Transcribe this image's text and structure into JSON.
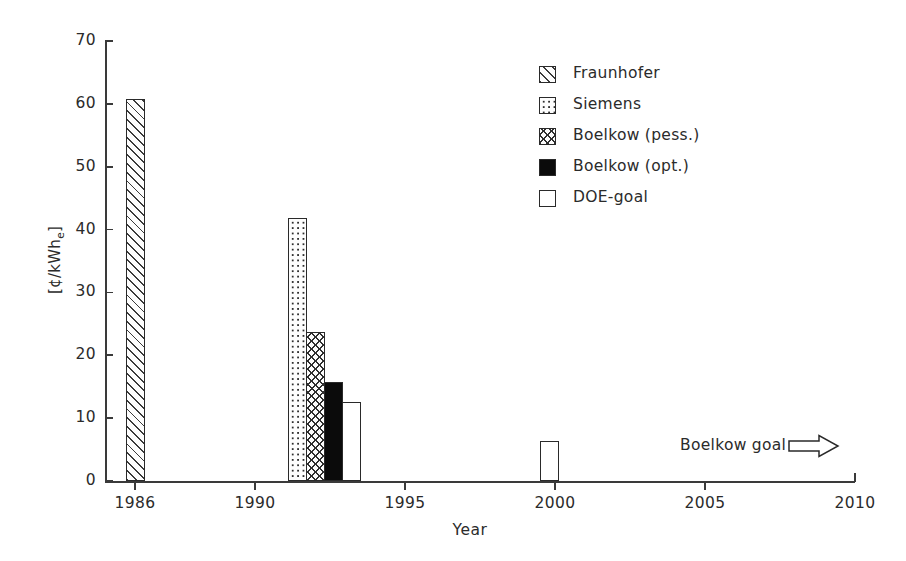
{
  "chart_data": {
    "type": "bar",
    "title": "",
    "xlabel": "Year",
    "ylabel": "[¢/kWhₑ]",
    "ylabel_parts": {
      "prefix": "[¢/kWh",
      "sub": "e",
      "suffix": "]"
    },
    "xlim": [
      1985,
      2010
    ],
    "ylim": [
      0,
      70
    ],
    "ytick_labels": [
      "0",
      "10",
      "20",
      "30",
      "40",
      "50",
      "60",
      "70"
    ],
    "ytick_values": [
      0,
      10,
      20,
      30,
      40,
      50,
      60,
      70
    ],
    "xtick_labels": [
      "1986",
      "1990",
      "1995",
      "2000",
      "2005",
      "2010"
    ],
    "xtick_values": [
      1986,
      1990,
      1995,
      2000,
      2005,
      2010
    ],
    "grid": false,
    "legend_position": "upper-center-right",
    "series": [
      {
        "name": "Fraunhofer",
        "pattern": "diagonal-hatch",
        "x": 1986,
        "value": 60.7
      },
      {
        "name": "Siemens",
        "pattern": "dots",
        "x": 1991.4,
        "value": 41.8
      },
      {
        "name": "Boelkow (pess.)",
        "pattern": "crosshatch",
        "x": 1992.0,
        "value": 23.7
      },
      {
        "name": "Boelkow (opt.)",
        "pattern": "solid-black",
        "x": 1992.6,
        "value": 15.7
      },
      {
        "name": "DOE-goal",
        "pattern": "empty",
        "x": 1993.2,
        "value": 12.6
      },
      {
        "name": "DOE-goal",
        "pattern": "empty",
        "x": 1999.8,
        "value": 6.3
      }
    ],
    "annotations": [
      {
        "text": "Boelkow goal",
        "icon": "right-arrow-icon",
        "x": 2006.5,
        "y": 7.2
      }
    ]
  },
  "legend": {
    "items": [
      {
        "label": "Fraunhofer",
        "pattern": "pat-hatch"
      },
      {
        "label": "Siemens",
        "pattern": "pat-dots"
      },
      {
        "label": "Boelkow (pess.)",
        "pattern": "pat-cross"
      },
      {
        "label": "Boelkow (opt.)",
        "pattern": "pat-solid"
      },
      {
        "label": "DOE-goal",
        "pattern": "pat-empty"
      }
    ]
  },
  "annotation": {
    "label": "Boelkow goal"
  },
  "colors": {
    "axis": "#3a3a3a",
    "text": "#2b2b2b",
    "bar_outline": "#2a2a2a",
    "solid_fill": "#0b0b0b",
    "background": "#ffffff"
  }
}
